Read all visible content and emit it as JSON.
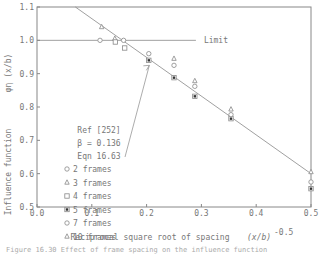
{
  "chart_data": {
    "type": "scatter",
    "title": "",
    "xlabel": "Reciprocal square root of spacing",
    "xlabel_math": "(x/b)",
    "xlabel_exponent": "-0.5",
    "ylabel": "Influence function",
    "ylabel_math": "φη (x/b)",
    "xlim": [
      0.0,
      0.5
    ],
    "ylim": [
      0.5,
      1.1
    ],
    "x_ticks": [
      "0.0",
      "0.1",
      "0.2",
      "0.3",
      "0.4",
      "0.5"
    ],
    "y_ticks": [
      "0.5",
      "0.6",
      "0.7",
      "0.8",
      "0.9",
      "1.0",
      "1.1"
    ],
    "grid": false,
    "reference_lines": [
      {
        "name": "Limit",
        "type": "horizontal",
        "y": 1.0,
        "x_range": [
          0.0,
          0.29
        ],
        "label": "Limit"
      },
      {
        "name": "Eqn 16.63",
        "type": "line",
        "points": [
          [
            0.07,
            1.1
          ],
          [
            0.5,
            0.6
          ]
        ]
      }
    ],
    "annotation": {
      "lines": [
        "Ref [252]",
        "β = 0.136",
        "Eqn 16.63"
      ]
    },
    "legend": {
      "position": "center-left",
      "entries": [
        {
          "marker": "circle",
          "label": "2 frames"
        },
        {
          "marker": "triangle",
          "label": "3 frames"
        },
        {
          "marker": "square",
          "label": "4 frames"
        },
        {
          "marker": "filled-square",
          "label": "5 frames"
        },
        {
          "marker": "circle",
          "label": "7 frames"
        },
        {
          "marker": "triangle",
          "label": "10 frames"
        }
      ]
    },
    "series": [
      {
        "name": "2 frames",
        "marker": "circle",
        "points": [
          [
            0.115,
            1.0
          ],
          [
            0.158,
            1.0
          ]
        ]
      },
      {
        "name": "3 frames",
        "marker": "triangle",
        "points": [
          [
            0.118,
            1.04
          ],
          [
            0.142,
            1.005
          ]
        ]
      },
      {
        "name": "4 frames",
        "marker": "square",
        "points": [
          [
            0.143,
            0.995
          ],
          [
            0.16,
            0.977
          ]
        ]
      },
      {
        "name": "5 frames",
        "marker": "filled-square",
        "points": [
          [
            0.204,
            0.94
          ],
          [
            0.25,
            0.888
          ],
          [
            0.288,
            0.832
          ],
          [
            0.354,
            0.765
          ],
          [
            0.5,
            0.555
          ]
        ]
      },
      {
        "name": "7 frames",
        "marker": "circle",
        "points": [
          [
            0.204,
            0.96
          ],
          [
            0.25,
            0.925
          ],
          [
            0.288,
            0.862
          ],
          [
            0.354,
            0.777
          ],
          [
            0.5,
            0.575
          ]
        ]
      },
      {
        "name": "10 frames",
        "marker": "triangle",
        "points": [
          [
            0.25,
            0.945
          ],
          [
            0.288,
            0.878
          ],
          [
            0.354,
            0.793
          ],
          [
            0.5,
            0.605
          ]
        ]
      }
    ]
  },
  "caption": "Figure 16.30 Effect of frame spacing on the influence function"
}
